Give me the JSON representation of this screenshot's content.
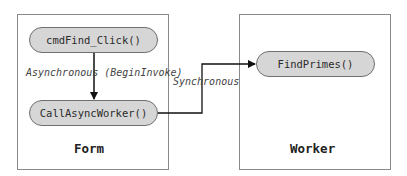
{
  "diagram": {
    "containers": [
      {
        "id": "form",
        "label": "Form"
      },
      {
        "id": "worker",
        "label": "Worker"
      }
    ],
    "nodes": {
      "cmd_find_click": "cmdFind_Click()",
      "call_async_worker": "CallAsyncWorker()",
      "find_primes": "FindPrimes()"
    },
    "edges": [
      {
        "from": "cmdFind_Click()",
        "to": "CallAsyncWorker()",
        "label": "Asynchronous (BeginInvoke)"
      },
      {
        "from": "CallAsyncWorker()",
        "to": "FindPrimes()",
        "label": "Synchronous"
      }
    ],
    "colors": {
      "node_fill": "#d6d6d6",
      "node_border": "#6f6f6f",
      "container_border": "#8a8a8a",
      "arrow": "#111111"
    }
  }
}
